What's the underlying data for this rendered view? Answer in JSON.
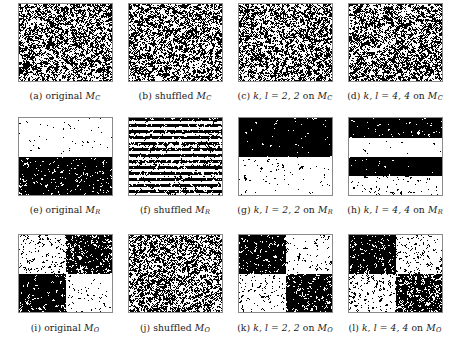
{
  "figure": {
    "rows": 3,
    "columns": 4,
    "background_color": "#ffffff",
    "ink_color": "#000000",
    "frame_color": "#8a8a8a"
  },
  "panels": [
    {
      "id": "a",
      "tag": "(a)",
      "caption": "(a) original M_C",
      "label_words": "original",
      "matrix_symbol": "M",
      "matrix_subscript": "C",
      "kl_text": "",
      "pattern": "uniform",
      "density": 0.5,
      "block_rows": 1,
      "block_cols": 1,
      "densities": [
        0.5
      ]
    },
    {
      "id": "b",
      "tag": "(b)",
      "caption": "(b) shuffled M_C",
      "label_words": "shuffled",
      "matrix_symbol": "M",
      "matrix_subscript": "C",
      "kl_text": "",
      "pattern": "uniform",
      "density": 0.5,
      "block_rows": 1,
      "block_cols": 1,
      "densities": [
        0.5
      ]
    },
    {
      "id": "c",
      "tag": "(c)",
      "caption": "(c) k,l = 2,2 on M_C",
      "label_words": "on",
      "matrix_symbol": "M",
      "matrix_subscript": "C",
      "kl_text": "k, l = 2, 2",
      "k": 2,
      "l": 2,
      "pattern": "uniform",
      "density": 0.5,
      "block_rows": 1,
      "block_cols": 1,
      "densities": [
        0.5
      ]
    },
    {
      "id": "d",
      "tag": "(d)",
      "caption": "(d) k,l = 4,4 on M_C",
      "label_words": "on",
      "matrix_symbol": "M",
      "matrix_subscript": "C",
      "kl_text": "k, l = 4, 4",
      "k": 4,
      "l": 4,
      "pattern": "uniform",
      "density": 0.5,
      "block_rows": 1,
      "block_cols": 1,
      "densities": [
        0.5
      ]
    },
    {
      "id": "e",
      "tag": "(e)",
      "caption": "(e) original M_R",
      "label_words": "original",
      "matrix_symbol": "M",
      "matrix_subscript": "R",
      "kl_text": "",
      "pattern": "row-bands",
      "block_rows": 2,
      "block_cols": 1,
      "densities": [
        0.22,
        0.74
      ]
    },
    {
      "id": "f",
      "tag": "(f)",
      "caption": "(f) shuffled M_R",
      "label_words": "shuffled",
      "matrix_symbol": "M",
      "matrix_subscript": "R",
      "kl_text": "",
      "pattern": "row-stripes",
      "block_rows": 26,
      "block_cols": 1,
      "densities": [
        0.72,
        0.26,
        0.7,
        0.24,
        0.68,
        0.3,
        0.74,
        0.22,
        0.66,
        0.32,
        0.7,
        0.25,
        0.73,
        0.28,
        0.65,
        0.33,
        0.71,
        0.24,
        0.69,
        0.3,
        0.72,
        0.26,
        0.68,
        0.31,
        0.7,
        0.27
      ]
    },
    {
      "id": "g",
      "tag": "(g)",
      "caption": "(g) k,l = 2,2 on M_R",
      "label_words": "on",
      "matrix_symbol": "M",
      "matrix_subscript": "R",
      "kl_text": "k, l = 2, 2",
      "k": 2,
      "l": 2,
      "pattern": "row-bands",
      "block_rows": 2,
      "block_cols": 1,
      "densities": [
        0.78,
        0.22
      ]
    },
    {
      "id": "h",
      "tag": "(h)",
      "caption": "(h) k,l = 4,4 on M_R",
      "label_words": "on",
      "matrix_symbol": "M",
      "matrix_subscript": "R",
      "kl_text": "k, l = 4, 4",
      "k": 4,
      "l": 4,
      "pattern": "row-bands",
      "block_rows": 4,
      "block_cols": 1,
      "densities": [
        0.76,
        0.2,
        0.8,
        0.26
      ]
    },
    {
      "id": "i",
      "tag": "(i)",
      "caption": "(i) original M_O",
      "label_words": "original",
      "matrix_symbol": "M",
      "matrix_subscript": "O",
      "kl_text": "",
      "pattern": "checker-blocks",
      "block_rows": 2,
      "block_cols": 2,
      "densities": [
        0.3,
        0.68,
        0.74,
        0.26
      ]
    },
    {
      "id": "j",
      "tag": "(j)",
      "caption": "(j) shuffled M_O",
      "label_words": "shuffled",
      "matrix_symbol": "M",
      "matrix_subscript": "O",
      "kl_text": "",
      "pattern": "uniform",
      "density": 0.5,
      "block_rows": 1,
      "block_cols": 1,
      "densities": [
        0.5
      ]
    },
    {
      "id": "k",
      "tag": "(k)",
      "caption": "(k) k,l = 2,2 on M_O",
      "label_words": "on",
      "matrix_symbol": "M",
      "matrix_subscript": "O",
      "kl_text": "k, l = 2, 2",
      "k": 2,
      "l": 2,
      "pattern": "checker-blocks",
      "block_rows": 2,
      "block_cols": 2,
      "densities": [
        0.72,
        0.26,
        0.28,
        0.7
      ]
    },
    {
      "id": "l",
      "tag": "(l)",
      "caption": "(l) k,l = 4,4 on M_O",
      "label_words": "on",
      "matrix_symbol": "M",
      "matrix_subscript": "O",
      "kl_text": "k, l = 4, 4",
      "k": 4,
      "l": 4,
      "pattern": "checker-blocks",
      "block_rows": 2,
      "block_cols": 2,
      "densities": [
        0.7,
        0.3,
        0.3,
        0.66
      ]
    }
  ]
}
